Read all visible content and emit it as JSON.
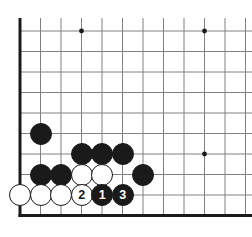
{
  "board": {
    "type": "go-board-diagram",
    "description": "Go (Baduk) problem diagram showing bottom-left corner",
    "visible_columns": 12,
    "visible_rows": 10,
    "grid_spacing_px": 20.5,
    "origin": {
      "x": 20,
      "y": 31
    },
    "edges": {
      "left": true,
      "bottom": true,
      "top": false,
      "right": false
    },
    "colors": {
      "background": "#ffffff",
      "line": "#808080",
      "edge_line": "#1a1a1a",
      "black_stone": "#1a1a1a",
      "white_stone": "#ffffff",
      "stone_outline": "#1a1a1a",
      "black_label": "#ffffff",
      "white_label": "#1a1a1a"
    },
    "star_points": [
      {
        "col": 3,
        "row": 0
      },
      {
        "col": 9,
        "row": 0
      },
      {
        "col": 9,
        "row": 6
      }
    ],
    "stones": [
      {
        "col": 1,
        "row": 5,
        "color": "black",
        "label": ""
      },
      {
        "col": 3,
        "row": 6,
        "color": "black",
        "label": ""
      },
      {
        "col": 4,
        "row": 6,
        "color": "black",
        "label": ""
      },
      {
        "col": 5,
        "row": 6,
        "color": "black",
        "label": ""
      },
      {
        "col": 1,
        "row": 7,
        "color": "black",
        "label": ""
      },
      {
        "col": 2,
        "row": 7,
        "color": "black",
        "label": ""
      },
      {
        "col": 3,
        "row": 7,
        "color": "white",
        "label": ""
      },
      {
        "col": 4,
        "row": 7,
        "color": "white",
        "label": ""
      },
      {
        "col": 6,
        "row": 7,
        "color": "black",
        "label": ""
      },
      {
        "col": 0,
        "row": 8,
        "color": "white",
        "label": ""
      },
      {
        "col": 1,
        "row": 8,
        "color": "white",
        "label": ""
      },
      {
        "col": 2,
        "row": 8,
        "color": "white",
        "label": ""
      },
      {
        "col": 3,
        "row": 8,
        "color": "white",
        "label": "2"
      },
      {
        "col": 4,
        "row": 8,
        "color": "black",
        "label": "1"
      },
      {
        "col": 5,
        "row": 8,
        "color": "black",
        "label": "3"
      }
    ],
    "move_sequence": [
      {
        "number": "1",
        "color": "black",
        "col": 4,
        "row": 8
      },
      {
        "number": "2",
        "color": "white",
        "col": 3,
        "row": 8
      },
      {
        "number": "3",
        "color": "black",
        "col": 5,
        "row": 8
      }
    ]
  }
}
